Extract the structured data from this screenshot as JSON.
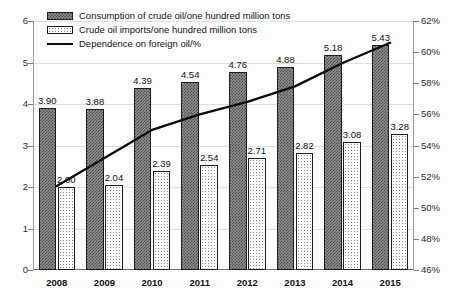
{
  "chart_data": {
    "type": "bar",
    "title": "",
    "xlabel": "",
    "ylabel": "",
    "categories": [
      "2008",
      "2009",
      "2010",
      "2011",
      "2012",
      "2013",
      "2014",
      "2015"
    ],
    "series": [
      {
        "name": "Consumption of crude oil/one hundred million tons",
        "type": "bar",
        "axis": "left",
        "values": [
          3.9,
          3.88,
          4.39,
          4.54,
          4.76,
          4.88,
          5.18,
          5.43
        ],
        "labels": [
          "3.90",
          "3.88",
          "4.39",
          "4.54",
          "4.76",
          "4.88",
          "5.18",
          "5.43"
        ]
      },
      {
        "name": "Crude oil imports/one hundred million tons",
        "type": "bar",
        "axis": "left",
        "values": [
          2.0,
          2.04,
          2.39,
          2.54,
          2.71,
          2.82,
          3.08,
          3.28
        ],
        "labels": [
          "2.00",
          "2.04",
          "2.39",
          "2.54",
          "2.71",
          "2.82",
          "3.08",
          "3.28"
        ]
      },
      {
        "name": "Dependence on foreign oil/%",
        "type": "line",
        "axis": "right",
        "values": [
          51.4,
          53.2,
          55.0,
          56.0,
          56.8,
          57.8,
          59.3,
          60.6
        ]
      }
    ],
    "ylim": [
      0,
      6
    ],
    "yticks": [
      "0",
      "1",
      "2",
      "3",
      "4",
      "5",
      "6"
    ],
    "y2lim": [
      46,
      62
    ],
    "y2ticks": [
      "46%",
      "48%",
      "50%",
      "52%",
      "54%",
      "56%",
      "58%",
      "60%",
      "62%"
    ],
    "grid": true,
    "legend_position": "top-left"
  },
  "legend": {
    "items": [
      {
        "label": "Consumption of crude oil/one hundred million tons",
        "swatch": "hatched-dark-square"
      },
      {
        "label": "Crude oil imports/one hundred million tons",
        "swatch": "dotted-light-square"
      },
      {
        "label": "Dependence on foreign oil/%",
        "swatch": "solid-black-line"
      }
    ]
  },
  "colors": {
    "consumption_bar": "#8e8e8e",
    "imports_bar": "#fbfbfb",
    "line": "#0b0b0b",
    "gridline": "#dedede",
    "axis": "#6d6d6d",
    "text": "#111111"
  }
}
